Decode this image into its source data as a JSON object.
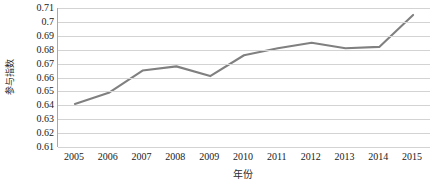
{
  "chart_data": {
    "type": "line",
    "title": "",
    "xlabel": "年份",
    "ylabel": "参与指数",
    "categories": [
      "2005",
      "2006",
      "2007",
      "2008",
      "2009",
      "2010",
      "2011",
      "2012",
      "2013",
      "2014",
      "2015"
    ],
    "x": [
      2005,
      2006,
      2007,
      2008,
      2009,
      2010,
      2011,
      2012,
      2013,
      2014,
      2015
    ],
    "values": [
      0.641,
      0.649,
      0.665,
      0.668,
      0.661,
      0.676,
      0.681,
      0.685,
      0.681,
      0.682,
      0.705
    ],
    "series": [
      {
        "name": "参与指数",
        "values": [
          0.641,
          0.649,
          0.665,
          0.668,
          0.661,
          0.676,
          0.681,
          0.685,
          0.681,
          0.682,
          0.705
        ],
        "color": "#808080"
      }
    ],
    "ylim": [
      0.61,
      0.71
    ],
    "ytick_labels": [
      "0.71",
      "0.7",
      "0.69",
      "0.68",
      "0.67",
      "0.66",
      "0.65",
      "0.64",
      "0.63",
      "0.62",
      "0.61"
    ],
    "ytick_values": [
      0.71,
      0.7,
      0.69,
      0.68,
      0.67,
      0.66,
      0.65,
      0.64,
      0.63,
      0.62,
      0.61
    ],
    "xtick_labels": [
      "2005",
      "2006",
      "2007",
      "2008",
      "2009",
      "2010",
      "2011",
      "2012",
      "2013",
      "2014",
      "2015"
    ],
    "grid": "horizontal",
    "legend": "none",
    "line_color": "#808080",
    "gridline_color": "#d3d3d3",
    "axis_color": "#a8a8a8",
    "background": "#ffffff",
    "markers": "none"
  }
}
